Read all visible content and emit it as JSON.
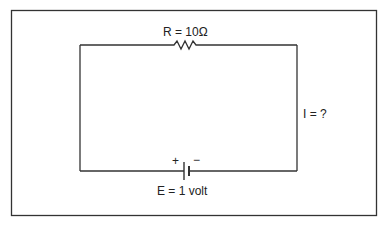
{
  "diagram": {
    "type": "simple DC circuit",
    "resistor_label": "R = 10Ω",
    "current_label": "I = ?",
    "battery_label": "E = 1 volt",
    "battery_plus": "+",
    "battery_minus": "−",
    "components": [
      {
        "name": "resistor",
        "value": "10Ω",
        "position": "top"
      },
      {
        "name": "battery",
        "value": "1 volt",
        "position": "bottom"
      }
    ]
  }
}
